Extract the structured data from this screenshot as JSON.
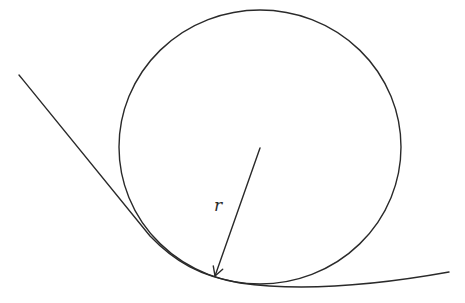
{
  "diagram": {
    "elements": {
      "curve": "Smooth curve",
      "circle": "Osculating circle",
      "radius": "Radius arrow from center to tangent point"
    },
    "labels": {
      "radius": "r"
    },
    "colors": {
      "stroke": "#2a2a2a",
      "background": "#ffffff"
    }
  }
}
